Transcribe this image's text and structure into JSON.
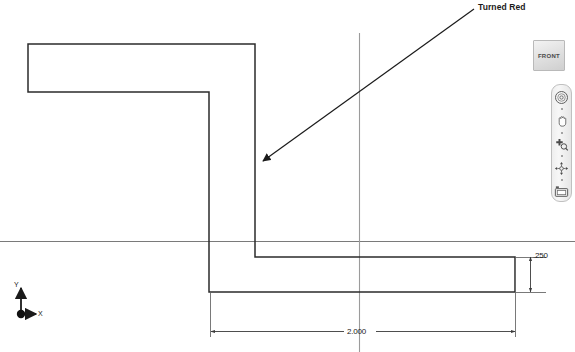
{
  "app": {
    "background_color": "#ffffff",
    "line_color": "#2b2b2b",
    "axis_color": "#6e6e6e"
  },
  "viewcube": {
    "name": "view-cube",
    "face_label": "FRONT"
  },
  "navbar": {
    "items": [
      {
        "icon": "steering-wheel-icon",
        "label": "Full Navigation Wheel"
      },
      {
        "icon": "pan-hand-icon",
        "label": "Pan"
      },
      {
        "icon": "zoom-magnifier-icon",
        "label": "Zoom"
      },
      {
        "icon": "orbit-icon",
        "label": "Orbit"
      },
      {
        "icon": "look-camera-icon",
        "label": "Look"
      }
    ]
  },
  "annotations": {
    "turned_red": "Turned Red"
  },
  "dimensions": {
    "horizontal": "2.000",
    "vertical": ".250"
  },
  "axis_indicator": {
    "x_label": "X",
    "y_label": "Y"
  },
  "sketch": {
    "type": "2d-profile",
    "profile_points": [
      [
        28,
        44
      ],
      [
        255,
        44
      ],
      [
        255,
        257
      ],
      [
        515,
        257
      ],
      [
        515,
        292
      ],
      [
        209,
        292
      ],
      [
        209,
        92
      ],
      [
        28,
        92
      ]
    ],
    "reference_lines": {
      "horizontal_axis_y": 241,
      "vertical_axis_x": 359
    }
  }
}
